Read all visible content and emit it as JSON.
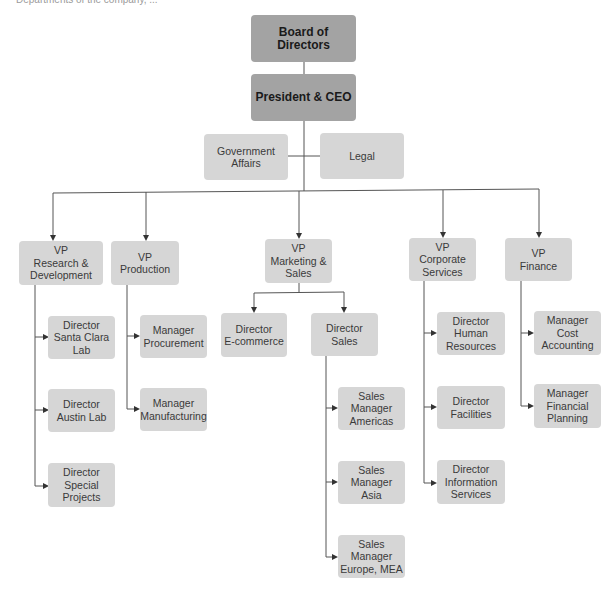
{
  "caption": "Departments of the company, ...",
  "colors": {
    "executive_box": "#a3a3a3",
    "unit_box": "#d6d6d6",
    "connector": "#555555"
  },
  "chart": {
    "top": {
      "board": "Board of Directors",
      "ceo": "President & CEO"
    },
    "staff": {
      "government_affairs": "Government\nAffairs",
      "legal": "Legal"
    },
    "vps": [
      {
        "label": "VP\nResearch &\nDevelopment",
        "children": [
          "Director\nSanta Clara\nLab",
          "Director\nAustin Lab",
          "Director\nSpecial\nProjects"
        ]
      },
      {
        "label": "VP\nProduction",
        "children": [
          "Manager\nProcurement",
          "Manager\nManufacturing"
        ]
      },
      {
        "label": "VP\nMarketing &\nSales",
        "children": [
          "Director\nE-commerce",
          "Director\nSales"
        ],
        "sales_children": [
          "Sales\nManager\nAmericas",
          "Sales\nManager\nAsia",
          "Sales\nManager\nEurope, MEA"
        ]
      },
      {
        "label": "VP\nCorporate\nServices",
        "children": [
          "Director\nHuman\nResources",
          "Director\nFacilities",
          "Director\nInformation\nServices"
        ]
      },
      {
        "label": "VP\nFinance",
        "children": [
          "Manager\nCost\nAccounting",
          "Manager\nFinancial\nPlanning"
        ]
      }
    ]
  }
}
